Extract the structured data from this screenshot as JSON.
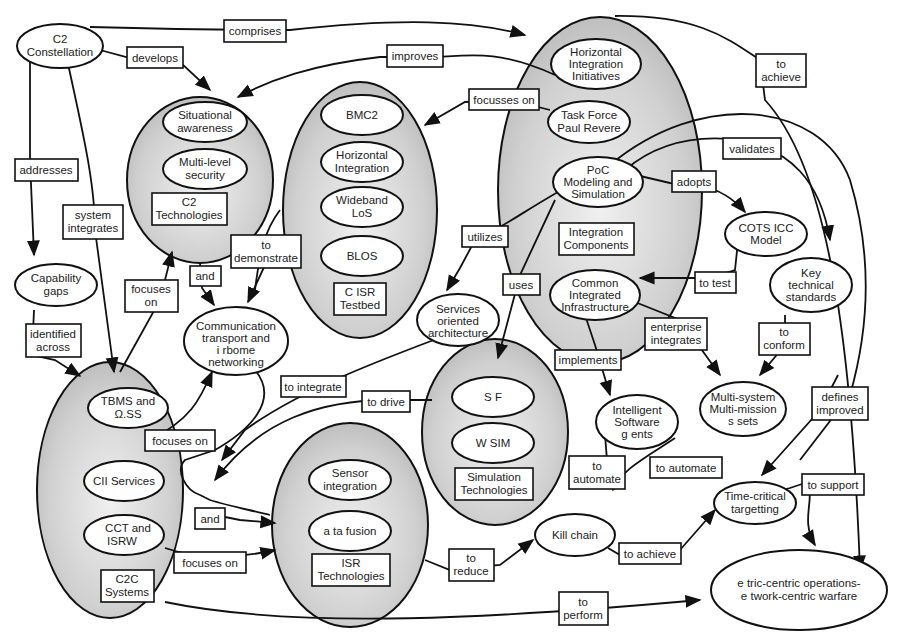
{
  "diagram": {
    "type": "concept-map",
    "colors": {
      "cluster_fill": "#c8c8c8",
      "cluster_highlight": "#eeeeee",
      "stroke": "#111111",
      "node_fill": "#ffffff"
    },
    "clusters": [
      {
        "id": "c2tech",
        "title": [
          "C2",
          "Technologies"
        ],
        "members": [
          [
            "Situational",
            "awareness"
          ],
          [
            "Multi-level",
            "security"
          ]
        ]
      },
      {
        "id": "c4isr",
        "title": [
          "C ISR",
          "Testbed"
        ],
        "members": [
          [
            "BMC2"
          ],
          [
            "Horizontal",
            "Integration"
          ],
          [
            "Wideband",
            "LoS"
          ],
          [
            "BLOS"
          ]
        ]
      },
      {
        "id": "hii",
        "title": [
          "Integration",
          "Components"
        ],
        "members": [
          [
            "Horizontal",
            "Integration",
            "Initiatives"
          ],
          [
            "Task Force",
            "Paul Revere"
          ],
          [
            "PoC",
            "Modeling and",
            "Simulation"
          ],
          [
            "Common",
            "Integrated",
            "Infrastructure"
          ]
        ]
      },
      {
        "id": "c2c",
        "title": [
          "C2C",
          "Systems"
        ],
        "members": [
          [
            "TBMS and",
            "Ω.SS"
          ],
          [
            "CII Services"
          ],
          [
            "CCT and",
            "ISRW"
          ]
        ]
      },
      {
        "id": "isr",
        "title": [
          "ISR",
          "Technologies"
        ],
        "members": [
          [
            "Sensor",
            "integration"
          ],
          [
            "a ta fusion"
          ]
        ]
      },
      {
        "id": "sim",
        "title": [
          "Simulation",
          "Technologies"
        ],
        "members": [
          [
            "S F"
          ],
          [
            "W SIM"
          ]
        ]
      }
    ],
    "nodes": [
      {
        "id": "c2const",
        "lines": [
          "C2",
          "Constellation"
        ]
      },
      {
        "id": "capgaps",
        "lines": [
          "Capability",
          "gaps"
        ]
      },
      {
        "id": "comm",
        "lines": [
          "Communication",
          "transport and",
          "i rbome",
          "networking"
        ]
      },
      {
        "id": "soa",
        "lines": [
          "Services",
          "oriented",
          "architecture"
        ]
      },
      {
        "id": "cots",
        "lines": [
          "COTS ICC",
          "Model"
        ]
      },
      {
        "id": "kts",
        "lines": [
          "Key",
          "technical",
          "standards"
        ]
      },
      {
        "id": "isa",
        "lines": [
          "Intelligent",
          "Software",
          "g ents"
        ]
      },
      {
        "id": "msms",
        "lines": [
          "Multi-system",
          "Multi-mission",
          "s sets"
        ]
      },
      {
        "id": "killchain",
        "lines": [
          "Kill chain"
        ]
      },
      {
        "id": "tct",
        "lines": [
          "Time-critical",
          "targetting"
        ]
      },
      {
        "id": "nco",
        "lines": [
          "e tric-centric operations-",
          "e twork-centric warfare"
        ]
      }
    ],
    "edge_labels": [
      {
        "id": "comprises",
        "lines": [
          "comprises"
        ]
      },
      {
        "id": "develops",
        "lines": [
          "develops"
        ]
      },
      {
        "id": "improves",
        "lines": [
          "improves"
        ]
      },
      {
        "id": "focusses_on",
        "lines": [
          "focusses on"
        ]
      },
      {
        "id": "to_achieve_top",
        "lines": [
          "to",
          "achieve"
        ]
      },
      {
        "id": "validates",
        "lines": [
          "validates"
        ]
      },
      {
        "id": "adopts",
        "lines": [
          "adopts"
        ]
      },
      {
        "id": "addresses",
        "lines": [
          "addresses"
        ]
      },
      {
        "id": "system_integrates",
        "lines": [
          "system",
          "integrates"
        ]
      },
      {
        "id": "to_demonstrate",
        "lines": [
          "to",
          "demonstrate"
        ]
      },
      {
        "id": "utilizes",
        "lines": [
          "utilizes"
        ]
      },
      {
        "id": "uses",
        "lines": [
          "uses"
        ]
      },
      {
        "id": "to_test",
        "lines": [
          "to test"
        ]
      },
      {
        "id": "focuses_on_top",
        "lines": [
          "focuses",
          "on"
        ]
      },
      {
        "id": "and_top",
        "lines": [
          "and"
        ]
      },
      {
        "id": "identified_across",
        "lines": [
          "identified",
          "across"
        ]
      },
      {
        "id": "enterprise_integrates",
        "lines": [
          "enterprise",
          "integrates"
        ]
      },
      {
        "id": "to_conform",
        "lines": [
          "to",
          "conform"
        ]
      },
      {
        "id": "implements",
        "lines": [
          "implements"
        ]
      },
      {
        "id": "to_integrate",
        "lines": [
          "to integrate"
        ]
      },
      {
        "id": "defines_improved",
        "lines": [
          "defines",
          "improved"
        ]
      },
      {
        "id": "to_drive",
        "lines": [
          "to drive"
        ]
      },
      {
        "id": "focuses_on_mid",
        "lines": [
          "focuses on"
        ]
      },
      {
        "id": "to_automate_left",
        "lines": [
          "to",
          "automate"
        ]
      },
      {
        "id": "to_automate_right",
        "lines": [
          "to automate"
        ]
      },
      {
        "id": "to_support",
        "lines": [
          "to support"
        ]
      },
      {
        "id": "and_bottom",
        "lines": [
          "and"
        ]
      },
      {
        "id": "focuses_on_bottom",
        "lines": [
          "focuses on"
        ]
      },
      {
        "id": "to_reduce",
        "lines": [
          "to",
          "reduce"
        ]
      },
      {
        "id": "to_achieve_bottom",
        "lines": [
          "to achieve"
        ]
      },
      {
        "id": "to_perform",
        "lines": [
          "to",
          "perform"
        ]
      }
    ]
  }
}
